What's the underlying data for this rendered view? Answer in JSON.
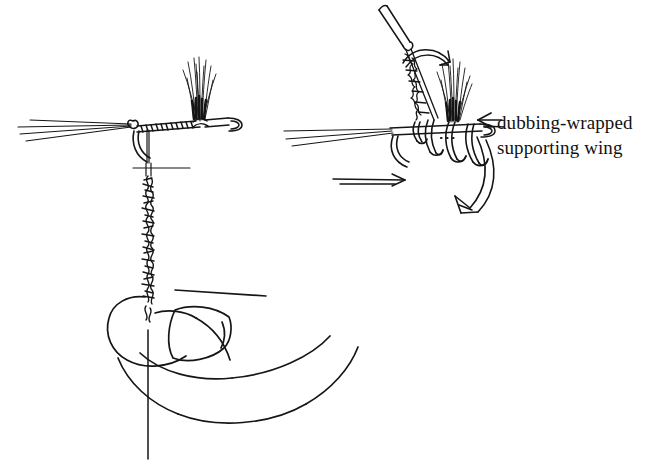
{
  "illustration": {
    "title": "Fly-tying step: dubbing-wrapped supporting wing",
    "style": "pen-and-ink line drawing",
    "background_color": "#ffffff",
    "ink_color": "#111111",
    "panels": [
      {
        "name": "left-panel",
        "description": "Hook held in vise with hair wing tied in; dubbed thread noodle hanging down from shank and held by fingers below",
        "elements": [
          "hook-shank-with-thread-wraps",
          "hook-eye",
          "hook-bend",
          "tail-fibers",
          "hair-wing-tuft",
          "dubbed-thread-strand",
          "thumb-and-finger",
          "thumbnail"
        ]
      },
      {
        "name": "right-panel",
        "description": "Close-up of bobbin wrapping dubbed thread around the base of the upright wing to form a supporting post",
        "elements": [
          "bobbin-tube",
          "dubbed-thread-strand",
          "rotation-arrow-small",
          "hair-wing-tuft",
          "thread-loops-around-wing-base",
          "hook-shank",
          "tail-fibers",
          "direction-arrow-shank",
          "sweeping-arrow-large"
        ]
      }
    ]
  },
  "labels": {
    "callout": {
      "line1": "dubbing-wrapped",
      "line2": "supporting wing",
      "arrow_icon": "arrow-left-icon",
      "arrow_direction": "left",
      "points_to": "thread-loops-around-wing-base"
    }
  }
}
